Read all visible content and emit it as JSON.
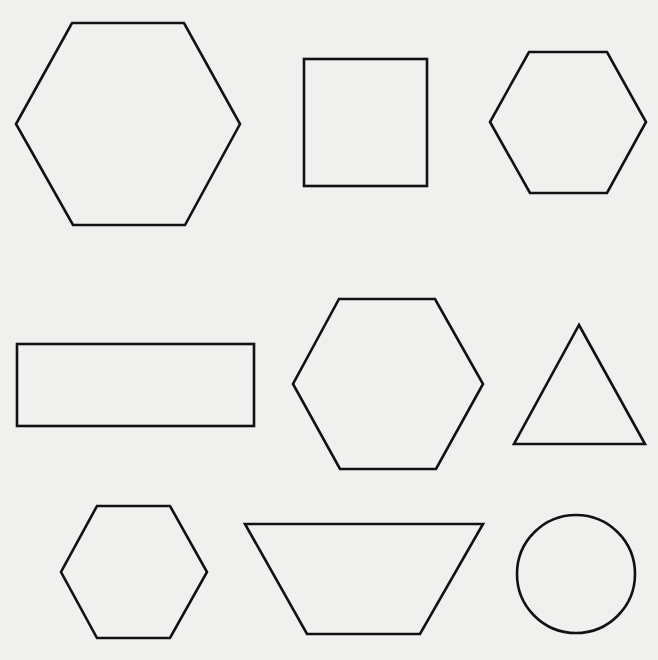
{
  "figure": {
    "background": "#f0f0ef",
    "stroke_color": "#111111",
    "stroke_width": 2.6,
    "shapes": [
      {
        "id": "hexagon-large-top-left",
        "type": "hexagon",
        "points": "72,23 184,23 240,124 185,225 73,225 16,124"
      },
      {
        "id": "square-top-middle",
        "type": "rect",
        "x": 304,
        "y": 59,
        "width": 123,
        "height": 127
      },
      {
        "id": "hexagon-top-right",
        "type": "hexagon",
        "points": "529,52 607,52 646,122 607,193 530,193 490,122"
      },
      {
        "id": "rectangle-middle-left",
        "type": "rect",
        "x": 17,
        "y": 344,
        "width": 237,
        "height": 82
      },
      {
        "id": "hexagon-center",
        "type": "hexagon",
        "points": "339,299 435,299 483,384 436,469 340,469 293,384"
      },
      {
        "id": "triangle-middle-right",
        "type": "triangle",
        "points": "579,325 645,444 514,444"
      },
      {
        "id": "hexagon-bottom-left",
        "type": "hexagon",
        "points": "97,506 170,506 207,572 170,638 97,638 61,572"
      },
      {
        "id": "trapezoid-bottom-middle",
        "type": "trapezoid",
        "points": "245,524 483,524 420,634 307,634"
      },
      {
        "id": "circle-bottom-right",
        "type": "circle",
        "cx": 576,
        "cy": 574,
        "r": 59
      }
    ]
  }
}
